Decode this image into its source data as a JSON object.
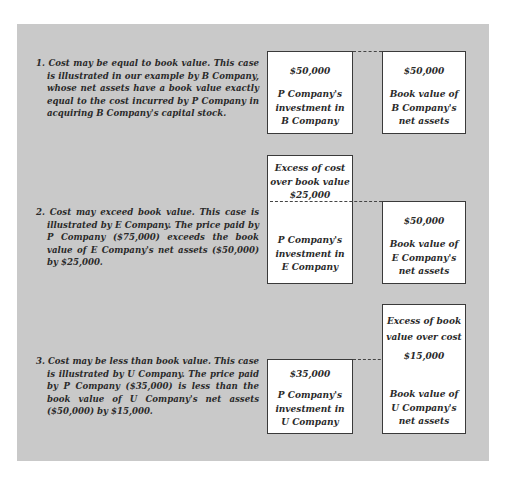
{
  "cases": [
    {
      "number": "1.",
      "text": "1. Cost may be equal to book value. This case is illustrated in our example by B Company, whose net assets have a book value exactly equal to the cost incurred by P Company in acquiring B Company's capital stock.",
      "left_box": {
        "amount": "$50,000",
        "lines": [
          "P Company's",
          "investment in",
          "B Company"
        ]
      },
      "right_box": {
        "amount": "$50,000",
        "lines": [
          "Book value of",
          "B Company's",
          "net assets"
        ]
      }
    },
    {
      "number": "2.",
      "text": "2. Cost may exceed book value. This case is illustrated by E Company. The price paid by P Company ($75,000) exceeds the book value of E Company's net assets ($50,000) by $25,000.",
      "left_box": {
        "excess_lines": [
          "Excess of cost",
          "over book value",
          "$25,000"
        ],
        "lines": [
          "P Company's",
          "investment in",
          "E Company"
        ]
      },
      "right_box": {
        "amount": "$50,000",
        "lines": [
          "Book value of",
          "E Company's",
          "net assets"
        ]
      }
    },
    {
      "number": "3.",
      "text": "3. Cost may be less than book value. This case is illustrated by U Company. The price paid by P Company ($35,000) is less than the book value of U Company's net assets ($50,000) by $15,000.",
      "left_box": {
        "amount": "$35,000",
        "lines": [
          "P Company's",
          "investment in",
          "U Company"
        ]
      },
      "right_box": {
        "excess_lines": [
          "Excess of book",
          "value over cost",
          "$15,000"
        ],
        "lines": [
          "Book value of",
          "U Company's",
          "net assets"
        ]
      }
    }
  ],
  "colors": {
    "panel_background": "#c9c9c9",
    "box_background": "#ffffff",
    "box_border": "#3a3a3a",
    "text": "#2a2a2a"
  }
}
